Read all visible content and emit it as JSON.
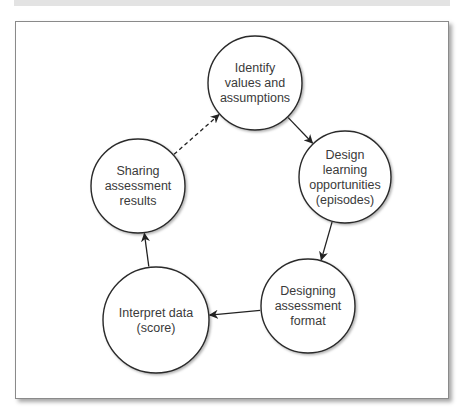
{
  "diagram": {
    "type": "cycle",
    "nodes": [
      {
        "id": "identify",
        "lines": [
          "Identify",
          "values and",
          "assumptions"
        ],
        "cx": 255,
        "cy": 83,
        "r": 47
      },
      {
        "id": "design",
        "lines": [
          "Design",
          "learning",
          "opportunities",
          "(episodes)"
        ],
        "cx": 345,
        "cy": 177,
        "r": 46
      },
      {
        "id": "designing",
        "lines": [
          "Designing",
          "assessment",
          "format"
        ],
        "cx": 308,
        "cy": 306,
        "r": 47
      },
      {
        "id": "interpret",
        "lines": [
          "Interpret data",
          "(score)"
        ],
        "cx": 156,
        "cy": 320,
        "r": 53
      },
      {
        "id": "sharing",
        "lines": [
          "Sharing",
          "assessment",
          "results"
        ],
        "cx": 138,
        "cy": 186,
        "r": 47
      }
    ],
    "edges": [
      {
        "from": "identify",
        "to": "design",
        "style": "solid"
      },
      {
        "from": "design",
        "to": "designing",
        "style": "solid"
      },
      {
        "from": "designing",
        "to": "interpret",
        "style": "solid"
      },
      {
        "from": "interpret",
        "to": "sharing",
        "style": "solid"
      },
      {
        "from": "sharing",
        "to": "identify",
        "style": "dashed"
      }
    ]
  }
}
